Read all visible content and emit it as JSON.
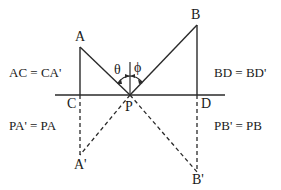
{
  "diagram": {
    "colors": {
      "line": "#2a2a2a",
      "background": "#ffffff"
    },
    "points": {
      "A": {
        "label": "A"
      },
      "B": {
        "label": "B"
      },
      "C": {
        "label": "C"
      },
      "D": {
        "label": "D"
      },
      "P": {
        "label": "P"
      },
      "A_prime": {
        "label": "A'"
      },
      "B_prime": {
        "label": "B'"
      }
    },
    "angles": {
      "theta": "θ",
      "phi": "ϕ"
    },
    "equations": {
      "ac_ca": "AC = CA'",
      "bd_bd": "BD = BD'",
      "pa_pa": "PA' = PA",
      "pb_pb": "PB' = PB"
    }
  }
}
